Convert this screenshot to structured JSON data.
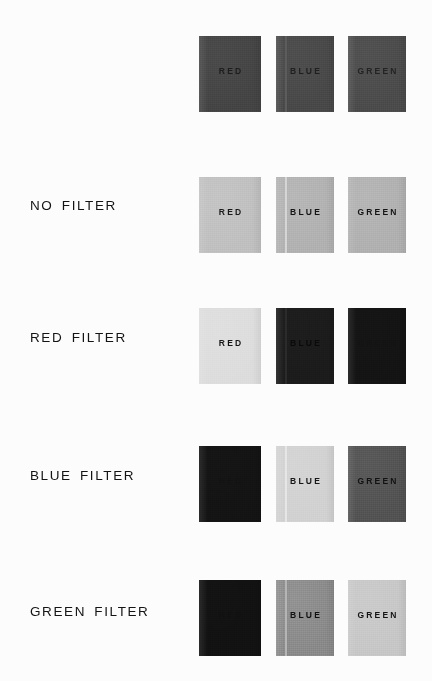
{
  "figure": {
    "background_color": "#fcfcfc",
    "label_color": "#141414",
    "card_names": [
      "RED",
      "BLUE",
      "GREEN"
    ],
    "columns": [
      {
        "name": "red-card",
        "caption": "RED",
        "x": 199,
        "width": 62
      },
      {
        "name": "blue-card",
        "caption": "BLUE",
        "x": 276,
        "width": 58,
        "seam_offset": 9
      },
      {
        "name": "green-card",
        "caption": "GREEN",
        "x": 348,
        "width": 58
      }
    ],
    "rows": [
      {
        "name": "unlabeled-reference",
        "label": "",
        "top": 36,
        "height": 76,
        "label_y": 0,
        "caption_y": 30,
        "swatches": [
          {
            "card": "RED",
            "fill": "#474747",
            "text_color": "#1d1d1d",
            "caption_visible": true
          },
          {
            "card": "BLUE",
            "fill": "#4b4b4b",
            "text_color": "#1f1f1f",
            "caption_visible": true,
            "seam_color": "#5c5c5c"
          },
          {
            "card": "GREEN",
            "fill": "#4e4e4e",
            "text_color": "#232323",
            "caption_visible": true
          }
        ]
      },
      {
        "name": "no-filter",
        "label": "NO FILTER",
        "top": 177,
        "height": 76,
        "label_y": 198,
        "caption_y": 30,
        "swatches": [
          {
            "card": "RED",
            "fill": "#c2c2c2",
            "text_color": "#1a1a1a",
            "caption_visible": true
          },
          {
            "card": "BLUE",
            "fill": "#b4b4b4",
            "text_color": "#141414",
            "caption_visible": true,
            "seam_color": "#d5d5d5"
          },
          {
            "card": "GREEN",
            "fill": "#b3b3b3",
            "text_color": "#141414",
            "caption_visible": true
          }
        ]
      },
      {
        "name": "red-filter",
        "label": "RED FILTER",
        "top": 308,
        "height": 76,
        "label_y": 330,
        "caption_y": 30,
        "swatches": [
          {
            "card": "RED",
            "fill": "#dedede",
            "text_color": "#171717",
            "caption_visible": true
          },
          {
            "card": "BLUE",
            "fill": "#1c1c1c",
            "text_color": "#0a0a0a",
            "caption_visible": true,
            "seam_color": "#2b2b2b"
          },
          {
            "card": "GREEN",
            "fill": "#141414",
            "text_color": "#111111",
            "caption_visible": false
          }
        ]
      },
      {
        "name": "blue-filter",
        "label": "BLUE FILTER",
        "top": 446,
        "height": 76,
        "label_y": 468,
        "caption_y": 30,
        "swatches": [
          {
            "card": "RED",
            "fill": "#141414",
            "text_color": "#101010",
            "caption_visible": false
          },
          {
            "card": "BLUE",
            "fill": "#d3d3d3",
            "text_color": "#161616",
            "caption_visible": true,
            "seam_color": "#e6e6e6"
          },
          {
            "card": "GREEN",
            "fill": "#565656",
            "text_color": "#121212",
            "caption_visible": true
          }
        ]
      },
      {
        "name": "green-filter",
        "label": "GREEN FILTER",
        "top": 580,
        "height": 76,
        "label_y": 604,
        "caption_y": 30,
        "swatches": [
          {
            "card": "RED",
            "fill": "#121212",
            "text_color": "#0e0e0e",
            "caption_visible": false
          },
          {
            "card": "BLUE",
            "fill": "#8e8e8e",
            "text_color": "#111111",
            "caption_visible": true,
            "seam_color": "#b5b5b5"
          },
          {
            "card": "GREEN",
            "fill": "#c9c9c9",
            "text_color": "#151515",
            "caption_visible": true
          }
        ]
      }
    ]
  }
}
